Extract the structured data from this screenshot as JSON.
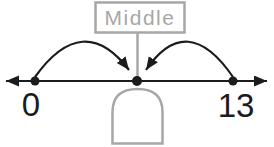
{
  "diagram": {
    "middle_label": "Middle",
    "left_endpoint_label": "0",
    "right_endpoint_label": "13",
    "cover_shape": "dome-cover",
    "colors": {
      "ink": "#1c1c1c",
      "muted": "#a7a7a7",
      "background": "#ffffff"
    }
  }
}
